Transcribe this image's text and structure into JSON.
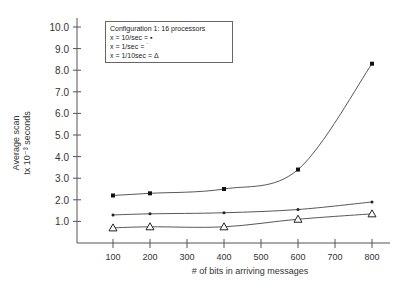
{
  "chart_data": {
    "type": "line",
    "title": "",
    "xlabel": "# of bits in arriving messages",
    "ylabel_line1": "Average scan",
    "ylabel_line2": "tx 10⁻³ seconds",
    "ylabel": "Average scan tx 10^-3 seconds",
    "x": [
      100,
      200,
      400,
      600,
      800
    ],
    "x_ticks": [
      100,
      200,
      300,
      400,
      500,
      600,
      700,
      800
    ],
    "x_tick_labels": [
      "100",
      "200",
      "300",
      "400",
      "500",
      "600",
      "700",
      "800"
    ],
    "y_ticks": [
      1.0,
      2.0,
      3.0,
      4.0,
      5.0,
      6.0,
      7.0,
      8.0,
      9.0,
      10.0
    ],
    "y_tick_labels": [
      "1.0",
      "2.0",
      "3.0",
      "4.0",
      "5.0",
      "6.0",
      "7.0",
      "8.0",
      "9.0",
      "10.0"
    ],
    "xlim": [
      0,
      850
    ],
    "ylim": [
      0,
      10.5
    ],
    "grid": false,
    "legend_position": "upper-left (inside plot)",
    "legend": {
      "title": "Configuration 1: 16 processors",
      "entries": [
        "x = 10/sec = ▪",
        "x = 1/sec = ˙",
        "x = 1/10sec = Δ"
      ]
    },
    "series": [
      {
        "name": "x = 10/sec",
        "marker": "square",
        "values": [
          2.2,
          2.3,
          2.5,
          3.4,
          8.3
        ]
      },
      {
        "name": "x = 1/sec",
        "marker": "dot",
        "values": [
          1.3,
          1.35,
          1.4,
          1.55,
          1.9
        ]
      },
      {
        "name": "x = 1/10sec",
        "marker": "triangle",
        "values": [
          0.7,
          0.75,
          0.75,
          1.1,
          1.35
        ]
      }
    ]
  }
}
